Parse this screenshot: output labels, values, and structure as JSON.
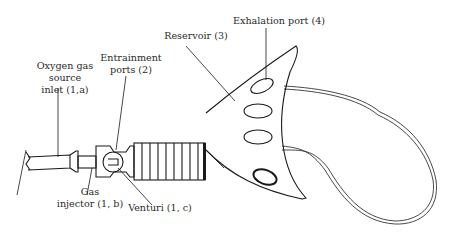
{
  "figure": {
    "labels": {
      "oxygen_inlet": [
        "Oxygen gas",
        "source",
        "inlet (1,a)"
      ],
      "entrainment_ports": [
        "Entrainment",
        "ports (2)"
      ],
      "gas_injector": [
        "Gas",
        "injector (1, b)"
      ],
      "venturi": "Venturi (1, c)",
      "reservoir": "Reservoir (3)",
      "exhalation_port": "Exhalation port (4)"
    },
    "colors": {
      "line": "#1a1a1a",
      "text": "#2a2a2a",
      "background": "#ffffff"
    }
  }
}
